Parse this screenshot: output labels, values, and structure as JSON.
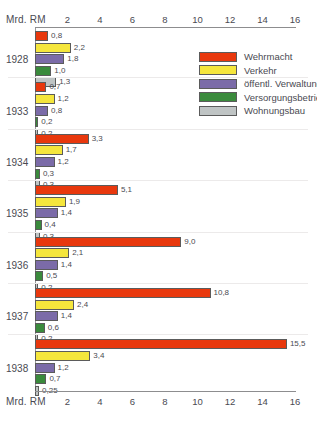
{
  "chart_data": {
    "type": "bar",
    "orientation": "horizontal",
    "title": "",
    "xlabel": "Mrd. RM",
    "ylabel": "",
    "xlim": [
      0,
      16
    ],
    "xticks": [
      2,
      4,
      6,
      8,
      10,
      12,
      14,
      16
    ],
    "grid": false,
    "legend_position": "top-right",
    "categories": [
      "1928",
      "1933",
      "1934",
      "1935",
      "1936",
      "1937",
      "1938"
    ],
    "series": [
      {
        "name": "Wehrmacht",
        "color": "#E8380D",
        "values": [
          0.8,
          0.7,
          3.3,
          5.1,
          9.0,
          10.8,
          15.5
        ],
        "labels": [
          "0,8",
          "0,7",
          "3,3",
          "5,1",
          "9,0",
          "10,8",
          "15,5"
        ]
      },
      {
        "name": "Verkehr",
        "color": "#F5E63C",
        "values": [
          2.2,
          1.2,
          1.7,
          1.9,
          2.1,
          2.4,
          3.4
        ],
        "labels": [
          "2,2",
          "1,2",
          "1,7",
          "1,9",
          "2,1",
          "2,4",
          "3,4"
        ]
      },
      {
        "name": "öffentl. Verwaltung",
        "color": "#7B6BA8",
        "values": [
          1.8,
          0.8,
          1.2,
          1.4,
          1.4,
          1.4,
          1.2
        ],
        "labels": [
          "1,8",
          "0,8",
          "1,2",
          "1,4",
          "1,4",
          "1,4",
          "1,2"
        ]
      },
      {
        "name": "Versorgungsbetriebe",
        "color": "#3A8A3C",
        "values": [
          1.0,
          0.2,
          0.3,
          0.4,
          0.5,
          0.6,
          0.7
        ],
        "labels": [
          "1,0",
          "0,2",
          "0,3",
          "0,4",
          "0,5",
          "0,6",
          "0,7"
        ]
      },
      {
        "name": "Wohnungsbau",
        "color": "#BFC4C4",
        "values": [
          1.3,
          0.2,
          0.3,
          0.3,
          0.2,
          0.2,
          0.25
        ],
        "labels": [
          "1,3",
          "0,2",
          "0,3",
          "0,3",
          "0,2",
          "0,2",
          "0,25"
        ]
      }
    ]
  },
  "axis": {
    "caption_top": "Mrd. RM",
    "caption_bottom": "Mrd. RM"
  }
}
